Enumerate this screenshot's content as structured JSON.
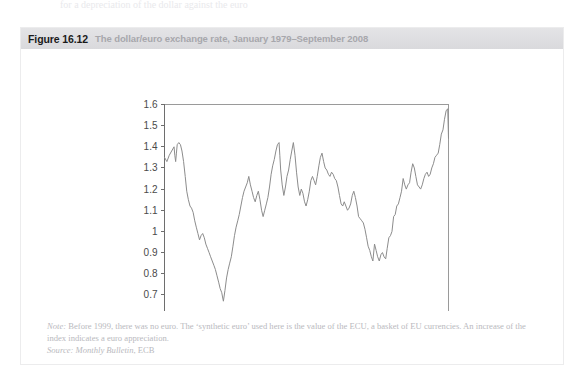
{
  "page": {
    "top_bleed_text": "for a depreciation of the dollar against the euro"
  },
  "figure": {
    "number": "Figure 16.12",
    "caption": "The dollar/euro exchange rate, January 1979–September 2008",
    "note_label": "Note:",
    "note_text": " Before 1999, there was no euro. The ‘synthetic euro’ used here is the value of the ECU, a basket of EU currencies. An increase of the index indicates a euro appreciation.",
    "source_label": "Source:",
    "source_publication": " Monthly Bulletin",
    "source_rest": ", ECB"
  },
  "colors": {
    "header_bg": "#dedee1",
    "figure_number": "#1b1b1b",
    "caption_gray": "#a7a7ac",
    "note_gray": "#b9b9be",
    "line": "#8c8c8c",
    "axis": "#6e6e6e",
    "box_border": "#ececed"
  },
  "chart_data": {
    "type": "line",
    "title": "The dollar/euro exchange rate, January 1979–September 2008",
    "xlabel": "",
    "ylabel": "",
    "grid": false,
    "legend": "none",
    "xlim": [
      1979.0,
      2008.75
    ],
    "ylim": [
      0.6,
      1.6
    ],
    "yticks": [
      0.6,
      0.7,
      0.8,
      0.9,
      1,
      1.1,
      1.2,
      1.3,
      1.4,
      1.5,
      1.6
    ],
    "ytick_labels": [
      "0.6",
      "0.7",
      "0.8",
      "0.9",
      "1",
      "1.1",
      "1.2",
      "1.3",
      "1.4",
      "1.5",
      "1.6"
    ],
    "xticks": [
      1979,
      1983,
      1987,
      1991,
      1995,
      1999,
      2003,
      2007
    ],
    "xtick_labels": [
      "Jan-79",
      "Jan-83",
      "Jan-87",
      "Jan-91",
      "Jan-95",
      "Jan-99",
      "Jan-03",
      "Jan-07"
    ],
    "series": [
      {
        "name": "USD per EUR (synthetic euro / ECU before 1999)",
        "x": [
          1979.0,
          1979.25,
          1979.5,
          1979.75,
          1980.0,
          1980.08,
          1980.17,
          1980.25,
          1980.33,
          1980.5,
          1980.67,
          1980.83,
          1981.0,
          1981.17,
          1981.33,
          1981.5,
          1981.67,
          1981.83,
          1982.0,
          1982.17,
          1982.33,
          1982.5,
          1982.67,
          1982.83,
          1983.0,
          1983.17,
          1983.33,
          1983.5,
          1983.67,
          1983.83,
          1984.0,
          1984.17,
          1984.33,
          1984.5,
          1984.67,
          1984.83,
          1985.0,
          1985.08,
          1985.17,
          1985.33,
          1985.5,
          1985.67,
          1985.83,
          1986.0,
          1986.17,
          1986.33,
          1986.5,
          1986.67,
          1986.83,
          1987.0,
          1987.17,
          1987.33,
          1987.5,
          1987.67,
          1987.83,
          1988.0,
          1988.17,
          1988.33,
          1988.5,
          1988.67,
          1988.83,
          1989.0,
          1989.17,
          1989.33,
          1989.5,
          1989.67,
          1989.83,
          1990.0,
          1990.17,
          1990.33,
          1990.5,
          1990.67,
          1990.83,
          1991.0,
          1991.08,
          1991.17,
          1991.33,
          1991.5,
          1991.67,
          1991.83,
          1992.0,
          1992.17,
          1992.33,
          1992.5,
          1992.67,
          1992.83,
          1993.0,
          1993.17,
          1993.33,
          1993.5,
          1993.67,
          1993.83,
          1994.0,
          1994.17,
          1994.33,
          1994.5,
          1994.67,
          1994.83,
          1995.0,
          1995.17,
          1995.33,
          1995.5,
          1995.67,
          1995.83,
          1996.0,
          1996.17,
          1996.33,
          1996.5,
          1996.67,
          1996.83,
          1997.0,
          1997.17,
          1997.33,
          1997.5,
          1997.67,
          1997.83,
          1998.0,
          1998.17,
          1998.33,
          1998.5,
          1998.67,
          1998.83,
          1999.0,
          1999.17,
          1999.33,
          1999.5,
          1999.67,
          1999.83,
          2000.0,
          2000.17,
          2000.33,
          2000.5,
          2000.67,
          2000.83,
          2001.0,
          2001.17,
          2001.33,
          2001.5,
          2001.67,
          2001.83,
          2002.0,
          2002.17,
          2002.33,
          2002.5,
          2002.67,
          2002.83,
          2003.0,
          2003.17,
          2003.33,
          2003.5,
          2003.67,
          2003.83,
          2004.0,
          2004.17,
          2004.33,
          2004.5,
          2004.67,
          2004.83,
          2005.0,
          2005.17,
          2005.33,
          2005.5,
          2005.67,
          2005.83,
          2006.0,
          2006.17,
          2006.33,
          2006.5,
          2006.67,
          2006.83,
          2007.0,
          2007.17,
          2007.33,
          2007.5,
          2007.67,
          2007.83,
          2008.0,
          2008.17,
          2008.33,
          2008.5,
          2008.67,
          2008.75
        ],
        "values": [
          1.35,
          1.33,
          1.36,
          1.38,
          1.4,
          1.36,
          1.33,
          1.37,
          1.41,
          1.42,
          1.41,
          1.38,
          1.33,
          1.26,
          1.19,
          1.15,
          1.12,
          1.11,
          1.09,
          1.05,
          1.02,
          0.99,
          0.96,
          0.98,
          0.99,
          0.97,
          0.94,
          0.92,
          0.9,
          0.88,
          0.86,
          0.84,
          0.82,
          0.79,
          0.76,
          0.73,
          0.71,
          0.69,
          0.67,
          0.72,
          0.78,
          0.82,
          0.85,
          0.88,
          0.93,
          0.98,
          1.02,
          1.05,
          1.08,
          1.12,
          1.16,
          1.19,
          1.21,
          1.23,
          1.26,
          1.22,
          1.19,
          1.16,
          1.14,
          1.17,
          1.19,
          1.15,
          1.1,
          1.07,
          1.1,
          1.13,
          1.16,
          1.21,
          1.27,
          1.31,
          1.34,
          1.38,
          1.41,
          1.42,
          1.36,
          1.29,
          1.22,
          1.17,
          1.21,
          1.26,
          1.29,
          1.34,
          1.38,
          1.42,
          1.36,
          1.28,
          1.21,
          1.17,
          1.2,
          1.18,
          1.14,
          1.12,
          1.15,
          1.19,
          1.24,
          1.26,
          1.24,
          1.22,
          1.26,
          1.31,
          1.35,
          1.37,
          1.33,
          1.3,
          1.29,
          1.27,
          1.26,
          1.28,
          1.27,
          1.25,
          1.24,
          1.21,
          1.17,
          1.13,
          1.12,
          1.14,
          1.12,
          1.1,
          1.11,
          1.13,
          1.17,
          1.19,
          1.16,
          1.12,
          1.07,
          1.06,
          1.05,
          1.04,
          1.01,
          0.97,
          0.93,
          0.91,
          0.88,
          0.86,
          0.94,
          0.91,
          0.88,
          0.86,
          0.89,
          0.9,
          0.88,
          0.87,
          0.92,
          0.97,
          0.98,
          1.0,
          1.07,
          1.08,
          1.12,
          1.13,
          1.16,
          1.19,
          1.25,
          1.22,
          1.2,
          1.22,
          1.23,
          1.28,
          1.32,
          1.3,
          1.26,
          1.22,
          1.21,
          1.2,
          1.22,
          1.25,
          1.27,
          1.28,
          1.26,
          1.27,
          1.3,
          1.32,
          1.35,
          1.36,
          1.37,
          1.41,
          1.46,
          1.48,
          1.53,
          1.57,
          1.58,
          1.44
        ]
      }
    ],
    "annotations": [
      {
        "label": "peak 1980",
        "value": 1.42
      },
      {
        "label": "trough early 1985",
        "value": 0.67
      },
      {
        "label": "peak 1991/1992",
        "value": 1.42
      },
      {
        "label": "trough 2000–2001",
        "value": 0.86
      },
      {
        "label": "peak 2008",
        "value": 1.58
      }
    ]
  }
}
